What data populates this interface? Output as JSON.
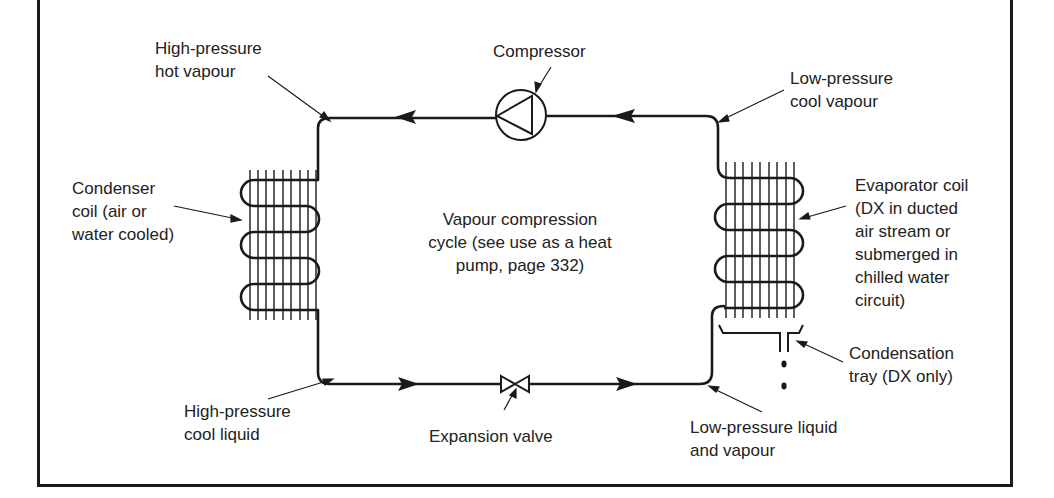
{
  "diagram": {
    "title": "Vapour compression cycle",
    "center_note": [
      "Vapour compression",
      "cycle (see use as a heat",
      "pump, page 332)"
    ],
    "components": {
      "compressor": "Compressor",
      "expansion_valve": "Expansion valve",
      "condenser": [
        "Condenser",
        "coil (air or",
        "water cooled)"
      ],
      "evaporator": [
        "Evaporator coil",
        "(DX in ducted",
        "air stream or",
        "submerged in",
        "chilled water",
        "circuit)"
      ],
      "condensation_tray": [
        "Condensation",
        "tray (DX only)"
      ]
    },
    "states": {
      "hp_hot_vapour": [
        "High-pressure",
        "hot vapour"
      ],
      "lp_cool_vapour": [
        "Low-pressure",
        "cool vapour"
      ],
      "hp_cool_liquid": [
        "High-pressure",
        "cool liquid"
      ],
      "lp_liquid_vapour": [
        "Low-pressure liquid",
        "and vapour"
      ]
    },
    "colors": {
      "line": "#1a1a1a",
      "background": "#ffffff"
    }
  }
}
